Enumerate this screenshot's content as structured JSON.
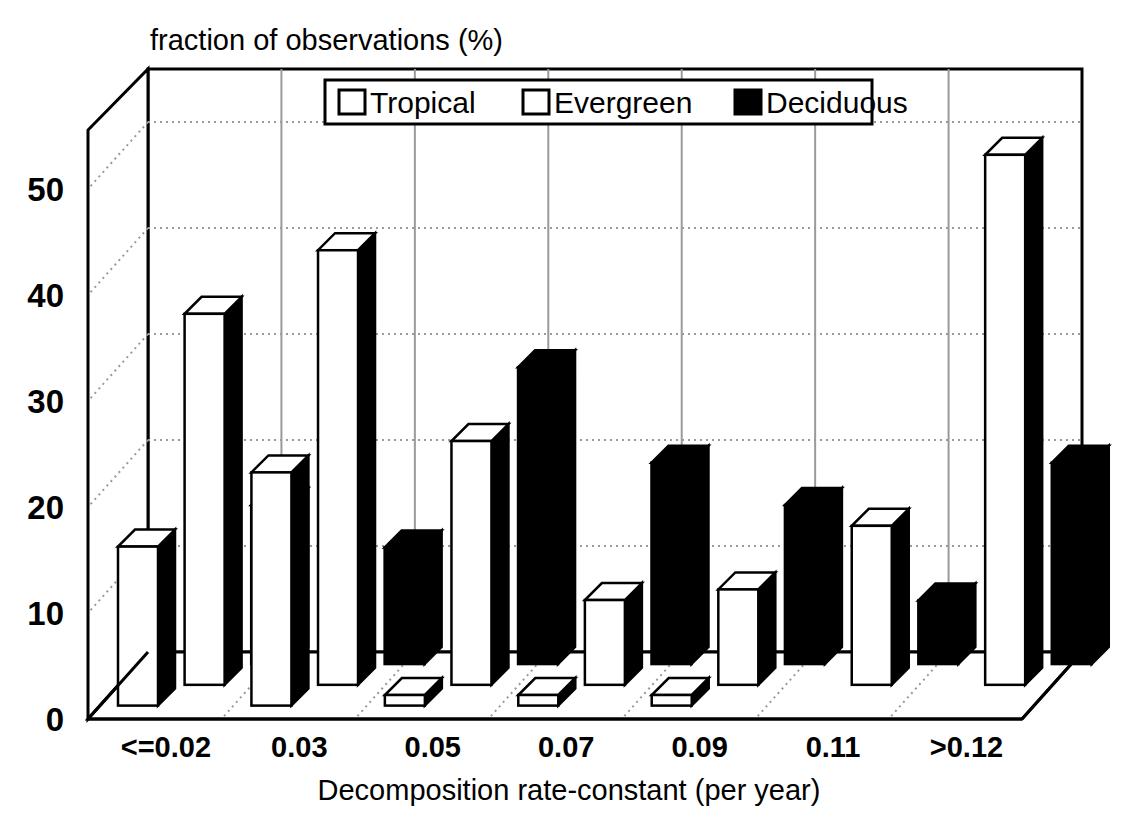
{
  "chart_data": {
    "type": "bar",
    "title": "fraction of observations (%)",
    "xlabel": "Decomposition rate-constant (per year)",
    "ylabel": "fraction of observations (%)",
    "categories": [
      "<=0.02",
      "0.03",
      "0.05",
      "0.07",
      "0.09",
      "0.11",
      ">0.12"
    ],
    "series": [
      {
        "name": "Tropical",
        "color": "#ffffff",
        "values": [
          15,
          22,
          1,
          1,
          1,
          0,
          0
        ]
      },
      {
        "name": "Evergreen",
        "color": "#ffffff",
        "values": [
          35,
          41,
          23,
          8,
          9,
          15,
          50
        ]
      },
      {
        "name": "Deciduous",
        "color": "#000000",
        "values": [
          15,
          11,
          28,
          19,
          15,
          6,
          19
        ]
      }
    ],
    "ylim": [
      0,
      55
    ],
    "yticks": [
      0,
      10,
      20,
      30,
      40,
      50
    ],
    "ytick_labels": [
      "0",
      "10",
      "20",
      "30",
      "40",
      "50"
    ],
    "grid": true,
    "legend_position": "top-center",
    "style": "3d-column"
  },
  "legend": {
    "entries": [
      {
        "label": "Tropical",
        "swatch": "white-square-icon"
      },
      {
        "label": "Evergreen",
        "swatch": "white-square-icon"
      },
      {
        "label": "Deciduous",
        "swatch": "black-square-icon"
      }
    ]
  },
  "colors": {
    "axis": "#000000",
    "grid": "#9a9a9a",
    "bar_light": "#ffffff",
    "bar_dark": "#000000",
    "background": "#ffffff"
  }
}
